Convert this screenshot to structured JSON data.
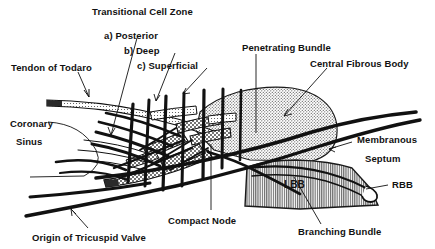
{
  "figure": {
    "type": "line-drawing-schematic",
    "background_color": "#ffffff",
    "ink_color": "#111111"
  },
  "labels": {
    "transitional_cell_zone": "Transitional Cell Zone",
    "posterior": "a) Posterior",
    "deep": "b) Deep",
    "superficial": "c) Superficial",
    "tendon_of_todaro": "Tendon of Todaro",
    "coronary": "Coronary",
    "sinus": "Sinus",
    "origin_of_tricuspid_valve": "Origin of Tricuspid Valve",
    "compact_node": "Compact Node",
    "penetrating_bundle": "Penetrating Bundle",
    "central_fibrous_body": "Central Fibrous Body",
    "membranous": "Membranous",
    "septum": "Septum",
    "rbb": "RBB",
    "lbb": "LBB",
    "branching_bundle": "Branching Bundle"
  },
  "regions": {
    "central_fibrous_body": {
      "fill": "stipple-dots",
      "tone": "#d8d8d8"
    },
    "branching_bundle": {
      "fill": "vertical-hatch",
      "tone": "#b9b9b9"
    },
    "compact_node": {
      "fill": "coarse-stipple",
      "tone": "#cfcfcf"
    },
    "tendon_of_todaro": {
      "fill": "fine-stipple",
      "tone": "#dedede"
    }
  }
}
